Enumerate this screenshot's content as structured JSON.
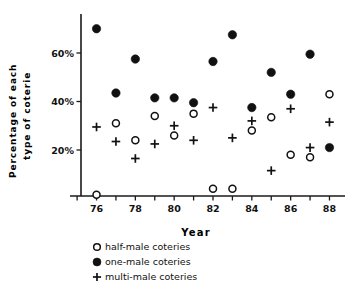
{
  "chart_data": {
    "type": "scatter",
    "title": "",
    "xlabel": "Year",
    "ylabel": "Percentage of each type of coterie",
    "ylabel_line1": "Percentage  of  each",
    "ylabel_line2": "type  of  coterie",
    "x": [
      76,
      77,
      78,
      79,
      80,
      81,
      82,
      83,
      84,
      85,
      86,
      87,
      88
    ],
    "xtick_labels": [
      "76",
      "78",
      "80",
      "82",
      "84",
      "86",
      "88"
    ],
    "xticks": [
      76,
      78,
      80,
      82,
      84,
      86,
      88
    ],
    "ytick_labels": [
      "20%",
      "40%",
      "60%"
    ],
    "yticks": [
      20,
      40,
      60
    ],
    "xlim": [
      75.2,
      88.8
    ],
    "ylim": [
      0,
      74
    ],
    "grid": false,
    "legend_position": "below-axis",
    "series": [
      {
        "name": "half-male coteries",
        "marker": "open-circle",
        "color": "#111111",
        "values": [
          1.5,
          31.0,
          24.0,
          34.0,
          26.0,
          35.0,
          4.0,
          4.0,
          28.0,
          33.5,
          18.0,
          17.0,
          43.0
        ]
      },
      {
        "name": "one-male coteries",
        "marker": "filled-circle",
        "color": "#111111",
        "values": [
          70.0,
          43.5,
          57.5,
          41.5,
          41.5,
          39.5,
          56.5,
          67.5,
          37.5,
          52.0,
          43.0,
          59.5,
          21.0
        ]
      },
      {
        "name": "multi-male coteries",
        "marker": "plus",
        "color": "#111111",
        "values": [
          29.5,
          23.5,
          16.5,
          22.5,
          30.0,
          24.0,
          37.5,
          25.0,
          32.0,
          11.5,
          37.0,
          21.0,
          31.5
        ]
      }
    ]
  },
  "legend": {
    "items": [
      {
        "marker": "open-circle",
        "label": "half-male  coteries"
      },
      {
        "marker": "filled-circle",
        "label": "one-male  coteries"
      },
      {
        "marker": "plus",
        "label": "multi-male  coteries"
      }
    ]
  },
  "axis": {
    "x_title": "Year"
  }
}
